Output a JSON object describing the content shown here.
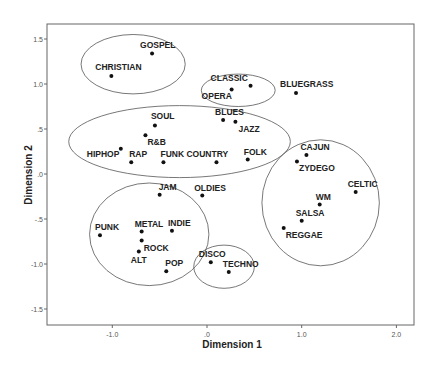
{
  "chart_data": {
    "type": "scatter",
    "title": "",
    "xlabel": "Dimension 1",
    "ylabel": "Dimension 2",
    "xlim": [
      -1.7,
      2.2
    ],
    "ylim": [
      -1.68,
      1.67
    ],
    "xticks": [
      {
        "value": -1.0,
        "label": "-1.0"
      },
      {
        "value": 0.0,
        "label": ".0"
      },
      {
        "value": 1.0,
        "label": "1.0"
      },
      {
        "value": 2.0,
        "label": "2.0"
      }
    ],
    "yticks": [
      {
        "value": 1.5,
        "label": "1.5"
      },
      {
        "value": 1.0,
        "label": "1.0"
      },
      {
        "value": 0.5,
        "label": ".5"
      },
      {
        "value": 0.0,
        "label": ".0"
      },
      {
        "value": -0.5,
        "label": "-.5"
      },
      {
        "value": -1.0,
        "label": "-1.0"
      },
      {
        "value": -1.5,
        "label": "-1.5"
      }
    ],
    "grid": false,
    "legend": null,
    "points": [
      {
        "label": "GOSPEL",
        "x": -0.58,
        "y": 1.34,
        "lx": -12,
        "ly": -5
      },
      {
        "label": "CHRISTIAN",
        "x": -1.01,
        "y": 1.09,
        "lx": -16,
        "ly": -6
      },
      {
        "label": "CLASSIC",
        "x": 0.46,
        "y": 0.98,
        "lx": -40,
        "ly": -5
      },
      {
        "label": "OPERA",
        "x": 0.26,
        "y": 0.94,
        "lx": -30,
        "ly": 10
      },
      {
        "label": "BLUEGRASS",
        "x": 0.94,
        "y": 0.9,
        "lx": -16,
        "ly": -6
      },
      {
        "label": "SOUL",
        "x": -0.55,
        "y": 0.54,
        "lx": -4,
        "ly": -6
      },
      {
        "label": "BLUES",
        "x": 0.17,
        "y": 0.6,
        "lx": -8,
        "ly": -5
      },
      {
        "label": "JAZZ",
        "x": 0.3,
        "y": 0.58,
        "lx": 3,
        "ly": 10
      },
      {
        "label": "R&B",
        "x": -0.65,
        "y": 0.43,
        "lx": 2,
        "ly": 10
      },
      {
        "label": "HIPHOP",
        "x": -0.91,
        "y": 0.28,
        "lx": -34,
        "ly": 8
      },
      {
        "label": "RAP",
        "x": -0.8,
        "y": 0.13,
        "lx": -2,
        "ly": -5
      },
      {
        "label": "FUNK",
        "x": -0.46,
        "y": 0.13,
        "lx": -3,
        "ly": -5
      },
      {
        "label": "COUNTRY",
        "x": 0.1,
        "y": 0.13,
        "lx": -30,
        "ly": -5
      },
      {
        "label": "FOLK",
        "x": 0.43,
        "y": 0.16,
        "lx": -4,
        "ly": -5
      },
      {
        "label": "CAJUN",
        "x": 1.05,
        "y": 0.21,
        "lx": -6,
        "ly": -5
      },
      {
        "label": "ZYDEGO",
        "x": 0.95,
        "y": 0.14,
        "lx": 2,
        "ly": 10
      },
      {
        "label": "CELTIC",
        "x": 1.57,
        "y": -0.2,
        "lx": -8,
        "ly": -5
      },
      {
        "label": "WM",
        "x": 1.19,
        "y": -0.34,
        "lx": -4,
        "ly": -5
      },
      {
        "label": "SALSA",
        "x": 1.0,
        "y": -0.52,
        "lx": -6,
        "ly": -5
      },
      {
        "label": "REGGAE",
        "x": 0.81,
        "y": -0.6,
        "lx": 2,
        "ly": 10
      },
      {
        "label": "JAM",
        "x": -0.5,
        "y": -0.23,
        "lx": -1,
        "ly": -5
      },
      {
        "label": "OLDIES",
        "x": -0.05,
        "y": -0.24,
        "lx": -8,
        "ly": -5
      },
      {
        "label": "PUNK",
        "x": -1.13,
        "y": -0.68,
        "lx": -5,
        "ly": -5
      },
      {
        "label": "METAL",
        "x": -0.69,
        "y": -0.64,
        "lx": -7,
        "ly": -5
      },
      {
        "label": "INDIE",
        "x": -0.37,
        "y": -0.63,
        "lx": -4,
        "ly": -5
      },
      {
        "label": "ROCK",
        "x": -0.69,
        "y": -0.74,
        "lx": 2,
        "ly": 10
      },
      {
        "label": "ALT",
        "x": -0.72,
        "y": -0.86,
        "lx": -8,
        "ly": 12
      },
      {
        "label": "POP",
        "x": -0.43,
        "y": -1.08,
        "lx": -1,
        "ly": -5
      },
      {
        "label": "DISCO",
        "x": 0.04,
        "y": -0.98,
        "lx": -12,
        "ly": -5
      },
      {
        "label": "TECHNO",
        "x": 0.23,
        "y": -1.09,
        "lx": -6,
        "ly": -5
      }
    ],
    "clusters": [
      {
        "name": "religious",
        "cx": -0.78,
        "cy": 1.22,
        "rx": 0.55,
        "ry": 0.33
      },
      {
        "name": "classical",
        "cx": 0.33,
        "cy": 0.93,
        "rx": 0.39,
        "ry": 0.18
      },
      {
        "name": "soul-blues-country",
        "cx": -0.29,
        "cy": 0.36,
        "rx": 1.17,
        "ry": 0.4
      },
      {
        "name": "world",
        "cx": 1.2,
        "cy": -0.32,
        "rx": 0.62,
        "ry": 0.7
      },
      {
        "name": "rock-pop",
        "cx": -0.61,
        "cy": -0.67,
        "rx": 0.63,
        "ry": 0.57
      },
      {
        "name": "dance",
        "cx": 0.18,
        "cy": -1.03,
        "rx": 0.32,
        "ry": 0.24
      }
    ]
  }
}
